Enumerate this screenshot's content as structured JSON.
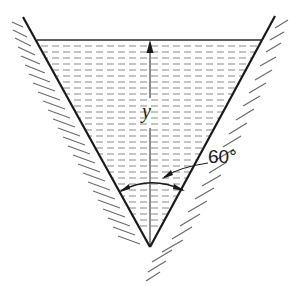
{
  "diagram": {
    "title": "",
    "labels": {
      "depth": "y",
      "angle": "60°"
    },
    "elements": {
      "channel": "V-shaped (triangular) channel with hatched walls",
      "water_surface": "free surface with dashed fill lines",
      "depth_arrow": "vertical arrow from vertex to free surface",
      "angle_arc": "arc between walls indicating included angle"
    },
    "colors": {
      "line": "#1a1a1a",
      "hatch": "#6b6b6b",
      "water_dash": "#8a8a8a"
    }
  }
}
